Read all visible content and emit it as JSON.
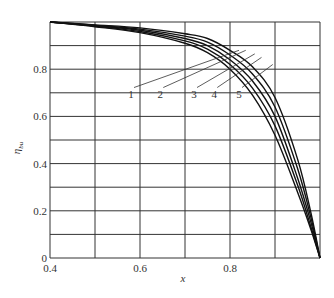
{
  "chart_data": {
    "type": "line",
    "title": "",
    "xlabel": "x",
    "ylabel": "η_bu",
    "xlim": [
      0.4,
      1.0
    ],
    "ylim": [
      0,
      1.0
    ],
    "grid": true,
    "x_ticks": [
      "0.4",
      "0.6",
      "0.8"
    ],
    "y_ticks": [
      "0",
      "0.2",
      "0.4",
      "0.6",
      "0.8"
    ],
    "x": [
      0.4,
      0.5,
      0.6,
      0.7,
      0.75,
      0.8,
      0.85,
      0.9,
      0.95,
      0.98,
      1.0
    ],
    "series": [
      {
        "name": "1",
        "values": [
          1.0,
          0.98,
          0.955,
          0.91,
          0.87,
          0.8,
          0.69,
          0.52,
          0.28,
          0.12,
          0.0
        ]
      },
      {
        "name": "2",
        "values": [
          1.0,
          0.982,
          0.96,
          0.92,
          0.885,
          0.82,
          0.72,
          0.56,
          0.31,
          0.13,
          0.0
        ]
      },
      {
        "name": "3",
        "values": [
          1.0,
          0.984,
          0.965,
          0.93,
          0.9,
          0.84,
          0.75,
          0.6,
          0.34,
          0.15,
          0.0
        ]
      },
      {
        "name": "4",
        "values": [
          1.0,
          0.986,
          0.97,
          0.94,
          0.915,
          0.86,
          0.78,
          0.64,
          0.38,
          0.17,
          0.0
        ]
      },
      {
        "name": "5",
        "values": [
          1.0,
          0.988,
          0.975,
          0.95,
          0.93,
          0.88,
          0.81,
          0.68,
          0.42,
          0.19,
          0.0
        ]
      }
    ],
    "annotations": [
      {
        "text": "1",
        "x": 0.58,
        "y": 0.68
      },
      {
        "text": "2",
        "x": 0.645,
        "y": 0.68
      },
      {
        "text": "3",
        "x": 0.72,
        "y": 0.68
      },
      {
        "text": "4",
        "x": 0.765,
        "y": 0.68
      },
      {
        "text": "5",
        "x": 0.82,
        "y": 0.68
      }
    ],
    "legend_position": "none"
  },
  "axis": {
    "x_label": "x",
    "y_label": "η",
    "y_label_sub": "bu"
  }
}
